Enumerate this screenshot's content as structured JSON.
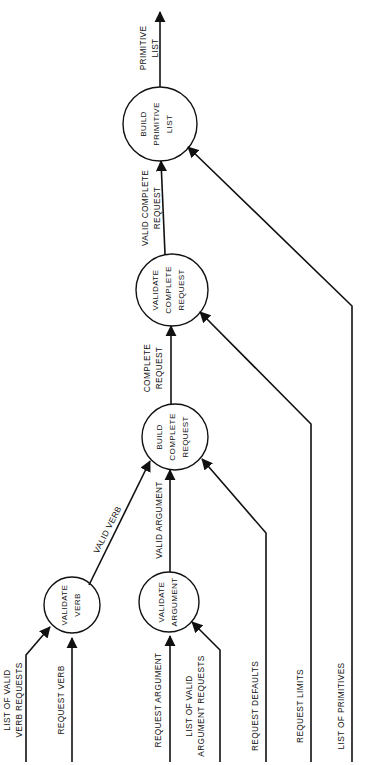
{
  "diagram": {
    "orientation": "rotated-90-ccw",
    "arrow_color": "#111111",
    "background_color": "#ffffff",
    "processes": [
      {
        "id": "validate-verb",
        "lines": [
          "VALIDATE",
          "VERB"
        ],
        "cx": 72,
        "cy": 605,
        "r": 28
      },
      {
        "id": "validate-argument",
        "lines": [
          "VALIDATE",
          "ARGUMENT"
        ],
        "cx": 169,
        "cy": 602,
        "r": 30
      },
      {
        "id": "build-complete-request",
        "lines": [
          "BUILD",
          "COMPLETE",
          "REQUEST"
        ],
        "cx": 175,
        "cy": 437,
        "r": 33
      },
      {
        "id": "validate-complete-request",
        "lines": [
          "VALIDATE",
          "COMPLETE",
          "REQUEST"
        ],
        "cx": 172,
        "cy": 290,
        "r": 36
      },
      {
        "id": "build-primitive-list",
        "lines": [
          "BUILD",
          "PRIMITIVE",
          "LIST"
        ],
        "cx": 160,
        "cy": 124,
        "r": 37
      }
    ],
    "flows": [
      {
        "id": "list-of-valid-verb-requests",
        "lines": [
          "LIST OF VALID",
          "VERB REQUESTS"
        ]
      },
      {
        "id": "request-verb",
        "lines": [
          "REQUEST VERB"
        ]
      },
      {
        "id": "request-argument",
        "lines": [
          "REQUEST ARGUMENT"
        ]
      },
      {
        "id": "list-of-valid-argument-requests",
        "lines": [
          "LIST OF VALID",
          "ARGUMENT REQUESTS"
        ]
      },
      {
        "id": "request-defaults",
        "lines": [
          "REQUEST DEFAULTS"
        ]
      },
      {
        "id": "request-limits",
        "lines": [
          "REQUEST LIMITS"
        ]
      },
      {
        "id": "list-of-primitives",
        "lines": [
          "LIST OF PRIMITIVES"
        ]
      },
      {
        "id": "valid-verb",
        "lines": [
          "VALID VERB"
        ]
      },
      {
        "id": "valid-argument",
        "lines": [
          "VALID ARGUMENT"
        ]
      },
      {
        "id": "complete-request",
        "lines": [
          "COMPLETE",
          "REQUEST"
        ]
      },
      {
        "id": "valid-complete-request",
        "lines": [
          "VALID COMPLETE",
          "REQUEST"
        ]
      },
      {
        "id": "primitive-list",
        "lines": [
          "PRIMITIVE",
          "LIST"
        ]
      }
    ],
    "labels": {
      "primitive_list_1": "PRIMITIVE",
      "primitive_list_2": "LIST",
      "valid_complete_request_1": "VALID COMPLETE",
      "valid_complete_request_2": "REQUEST",
      "complete_request_1": "COMPLETE",
      "complete_request_2": "REQUEST",
      "valid_verb": "VALID VERB",
      "valid_argument": "VALID ARGUMENT",
      "list_of_valid_verb_requests_1": "LIST OF VALID",
      "list_of_valid_verb_requests_2": "VERB REQUESTS",
      "request_verb": "REQUEST VERB",
      "request_argument": "REQUEST ARGUMENT",
      "list_of_valid_argument_requests_1": "LIST OF VALID",
      "list_of_valid_argument_requests_2": "ARGUMENT REQUESTS",
      "request_defaults": "REQUEST DEFAULTS",
      "request_limits": "REQUEST LIMITS",
      "list_of_primitives": "LIST OF PRIMITIVES",
      "build_primitive_list_1": "BUILD",
      "build_primitive_list_2": "PRIMITIVE",
      "build_primitive_list_3": "LIST",
      "validate_complete_request_1": "VALIDATE",
      "validate_complete_request_2": "COMPLETE",
      "validate_complete_request_3": "REQUEST",
      "build_complete_request_1": "BUILD",
      "build_complete_request_2": "COMPLETE",
      "build_complete_request_3": "REQUEST",
      "validate_verb_1": "VALIDATE",
      "validate_verb_2": "VERB",
      "validate_argument_1": "VALIDATE",
      "validate_argument_2": "ARGUMENT"
    }
  }
}
